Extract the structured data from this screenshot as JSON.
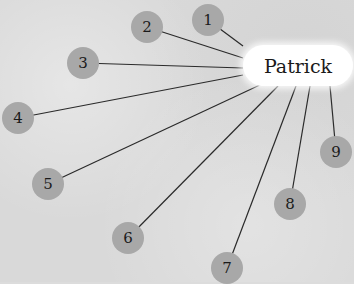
{
  "center": {
    "label": "Patrick",
    "x": 298,
    "y": 65
  },
  "nodes": [
    {
      "label": "1",
      "x": 208,
      "y": 20,
      "lx": 243,
      "ly": 46
    },
    {
      "label": "2",
      "x": 147,
      "y": 27,
      "lx": 243,
      "ly": 58
    },
    {
      "label": "3",
      "x": 83,
      "y": 63,
      "lx": 243,
      "ly": 68
    },
    {
      "label": "4",
      "x": 18,
      "y": 118,
      "lx": 243,
      "ly": 75
    },
    {
      "label": "5",
      "x": 48,
      "y": 184,
      "lx": 262,
      "ly": 84
    },
    {
      "label": "6",
      "x": 128,
      "y": 238,
      "lx": 278,
      "ly": 86
    },
    {
      "label": "7",
      "x": 227,
      "y": 268,
      "lx": 296,
      "ly": 86
    },
    {
      "label": "8",
      "x": 290,
      "y": 204,
      "lx": 310,
      "ly": 86
    },
    {
      "label": "9",
      "x": 336,
      "y": 152,
      "lx": 330,
      "ly": 86
    }
  ],
  "colors": {
    "node": "#a8a8a8",
    "line": "#2a2a2a",
    "center": "#ffffff"
  }
}
